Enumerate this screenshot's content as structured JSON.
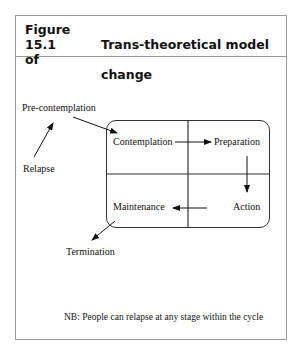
{
  "figure": {
    "number": "Figure 15.1",
    "title_line1": "Trans-theoretical model of",
    "title_line2": "change"
  },
  "stages": {
    "pre_contemplation": "Pre-contemplation",
    "relapse": "Relapse",
    "contemplation": "Contemplation",
    "preparation": "Preparation",
    "action": "Action",
    "maintenance": "Maintenance",
    "termination": "Termination"
  },
  "note": "NB: People can relapse at any stage within the cycle"
}
